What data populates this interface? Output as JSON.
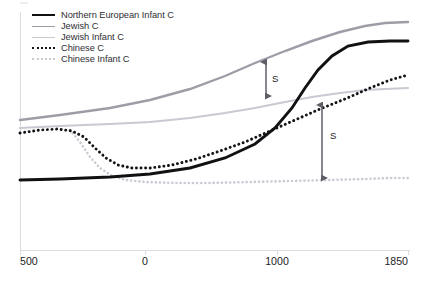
{
  "figure": {
    "title": "",
    "background": "#ffffff",
    "axis_color": "#dcdce2"
  },
  "legend": {
    "position": "top-left",
    "items": [
      {
        "label": "Northern European Infant C",
        "style": "solid",
        "color": "#111114",
        "width": 2.6,
        "icon": "line-sample-icon"
      },
      {
        "label": "Jewish C",
        "style": "solid",
        "color": "#9d9da8",
        "width": 1.9,
        "icon": "line-sample-icon"
      },
      {
        "label": "Jewish Infant C",
        "style": "solid",
        "color": "#c9c9d2",
        "width": 1.7,
        "icon": "line-sample-icon"
      },
      {
        "label": "Chinese  C",
        "style": "dotted",
        "color": "#141418",
        "width": 2.6,
        "icon": "line-sample-icon"
      },
      {
        "label": "Chinese Infant C",
        "style": "dotted",
        "color": "#cbcbd4",
        "width": 2.2,
        "icon": "line-sample-icon"
      }
    ]
  },
  "xaxis": {
    "ticks": [
      {
        "label": "500",
        "px": 20,
        "align": "left"
      },
      {
        "label": "0",
        "px": 145,
        "align": "center"
      },
      {
        "label": "1000",
        "px": 277,
        "align": "center"
      },
      {
        "label": "1850",
        "px": 408,
        "align": "right"
      }
    ]
  },
  "annotations": [
    {
      "name": "s-arrow-upper",
      "label": "S",
      "x_px": 266,
      "y_top_px": 62,
      "y_bottom_px": 96,
      "label_x_px": 272,
      "label_y_px": 73,
      "color": "#1d1d21"
    },
    {
      "name": "s-arrow-lower",
      "label": "S",
      "x_px": 322,
      "y_top_px": 105,
      "y_bottom_px": 178,
      "label_x_px": 330,
      "label_y_px": 130,
      "color": "#1d1d21"
    }
  ],
  "chart_data": {
    "type": "line",
    "title": "",
    "xlabel": "",
    "ylabel": "",
    "xlim": [
      -500,
      1850
    ],
    "ylim": [
      0,
      1
    ],
    "grid": false,
    "legend_position": "top-left",
    "x_tick_labels": [
      "500",
      "0",
      "1000",
      "1850"
    ],
    "x_tick_values": [
      -500,
      0,
      1000,
      1850
    ],
    "annotations": [
      {
        "text": "S",
        "type": "double-headed-arrow",
        "description": "gap between Jewish C and Jewish Infant C"
      },
      {
        "text": "S",
        "type": "double-headed-arrow",
        "description": "gap between Chinese C and Chinese Infant C"
      }
    ],
    "series": [
      {
        "name": "Northern European Infant C",
        "style": "solid",
        "color": "#111114",
        "width": 2.9,
        "points_px": "20,180 60,179 110,177 150,174 190,168 225,158 255,144 275,128 292,108 305,88 318,70 332,56 348,46 368,42 390,41 408,41"
      },
      {
        "name": "Jewish C",
        "style": "solid",
        "color": "#9d9da8",
        "width": 2.4,
        "points_px": "20,120 60,115 110,108 150,100 190,89 225,76 255,63 285,51 312,41 340,32 365,26 385,23 408,22"
      },
      {
        "name": "Jewish Infant C",
        "style": "solid",
        "color": "#c9c9d2",
        "width": 2.2,
        "points_px": "20,128 60,126 110,124 150,122 190,118 225,113 255,108 285,102 312,97 340,93 365,90 385,89 408,88"
      },
      {
        "name": "Chinese  C",
        "style": "dotted",
        "color": "#141418",
        "width": 2.9,
        "points_px": "20,133 40,130 58,129 72,131 84,137 95,148 106,158 118,165 132,168 150,168 172,165 196,159 220,151 245,142 270,131 295,120 320,109 345,99 370,88 390,80 408,75"
      },
      {
        "name": "Chinese Infant C",
        "style": "dotted",
        "color": "#cbcbd4",
        "width": 2.6,
        "points_px": "70,130 80,142 90,157 100,168 112,176 126,180 145,182 175,183 210,183 250,182 290,181 330,180 365,179 390,178 408,178"
      }
    ]
  }
}
